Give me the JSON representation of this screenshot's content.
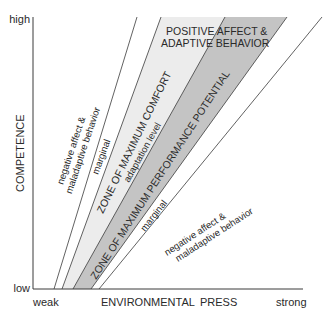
{
  "axes": {
    "y_label": "COMPETENCE",
    "y_high": "high",
    "y_low": "low",
    "x_label_left": "ENVIRONMENTAL",
    "x_label_right": "PRESS",
    "x_weak": "weak",
    "x_strong": "strong"
  },
  "zones": {
    "upper_negative_line1": "negative affect &",
    "upper_negative_line2": "maladaptive behavior",
    "upper_marginal": "marginal",
    "max_comfort": "ZONE OF MAXIMUM COMFORT",
    "adaptation_level": "adaptation level",
    "max_performance": "ZONE OF MAXIMUM PERFORMANCE POTENTIAL",
    "lower_marginal": "marginal",
    "lower_negative_line1": "negative affect &",
    "lower_negative_line2": "maladaptive behavior",
    "positive_line1": "POSITIVE AFFECT &",
    "positive_line2": "ADAPTIVE BEHAVIOR"
  },
  "colors": {
    "comfort_zone": "#ececec",
    "performance_zone": "#c4c4c4",
    "lines": "#3a3a3a"
  }
}
